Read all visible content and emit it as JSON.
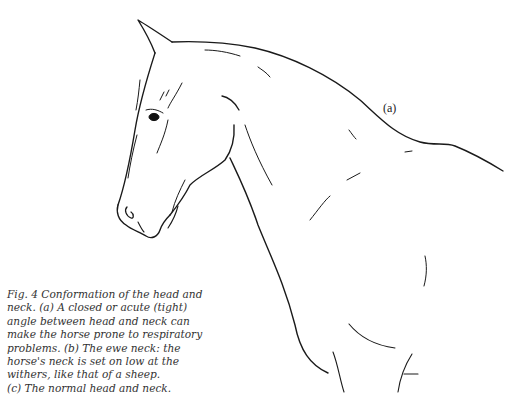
{
  "figure": {
    "label": "(a)"
  },
  "caption": {
    "lines": [
      "Fig. 4  Conformation of the head and",
      "neck.  (a) A closed or acute (tight)",
      "angle between head and neck can",
      "make the horse prone to respiratory",
      "problems.  (b) The ewe neck: the",
      "horse's neck is set on low at the",
      "withers, like that of a sheep.",
      "(c) The normal head and neck."
    ]
  }
}
